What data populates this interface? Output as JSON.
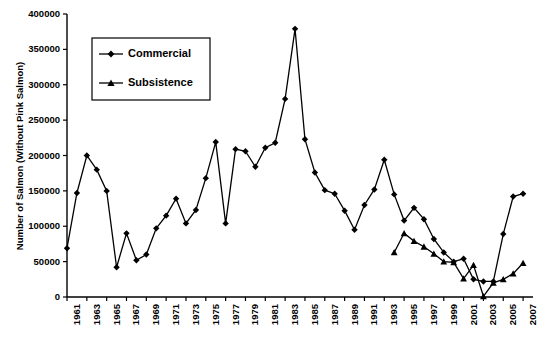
{
  "chart_data": {
    "type": "line",
    "title": "",
    "xlabel": "",
    "ylabel": "Number of Salmon (Without Pink Salmon)",
    "ylim": [
      0,
      400000
    ],
    "ytick_labels": [
      "0",
      "50000",
      "100000",
      "150000",
      "200000",
      "250000",
      "300000",
      "350000",
      "400000"
    ],
    "ytick_values": [
      0,
      50000,
      100000,
      150000,
      200000,
      250000,
      300000,
      350000,
      400000
    ],
    "xlim": [
      1961,
      2008
    ],
    "xtick_labels": [
      "1961",
      "1963",
      "1965",
      "1967",
      "1969",
      "1971",
      "1973",
      "1975",
      "1977",
      "1979",
      "1981",
      "1983",
      "1985",
      "1987",
      "1989",
      "1991",
      "1993",
      "1995",
      "1997",
      "1999",
      "2001",
      "2003",
      "2005",
      "2007"
    ],
    "grid": false,
    "legend_position": "upper-left",
    "series": [
      {
        "name": "Commercial",
        "marker": "diamond",
        "color": "#000000",
        "x": [
          1961,
          1962,
          1963,
          1964,
          1965,
          1966,
          1967,
          1968,
          1969,
          1970,
          1971,
          1972,
          1973,
          1974,
          1975,
          1976,
          1977,
          1978,
          1979,
          1980,
          1981,
          1982,
          1983,
          1984,
          1985,
          1986,
          1987,
          1988,
          1989,
          1990,
          1991,
          1992,
          1993,
          1994,
          1995,
          1996,
          1997,
          1998,
          1999,
          2000,
          2001,
          2002,
          2003,
          2004,
          2005,
          2006,
          2007
        ],
        "y": [
          69000,
          147000,
          200000,
          180000,
          150000,
          42000,
          90000,
          52000,
          60000,
          97000,
          115000,
          139000,
          104000,
          123000,
          168000,
          219000,
          104000,
          209000,
          206000,
          184000,
          211000,
          218000,
          280000,
          379000,
          223000,
          176000,
          151000,
          146000,
          122000,
          95000,
          130000,
          152000,
          194000,
          145000,
          108000,
          126000,
          110000,
          82000,
          63000,
          50000,
          54000,
          25000,
          22000,
          22000,
          89000,
          142000,
          146000
        ]
      },
      {
        "name": "Subsistence",
        "marker": "triangle",
        "color": "#000000",
        "x": [
          1994,
          1995,
          1996,
          1997,
          1998,
          1999,
          2000,
          2001,
          2002,
          2003,
          2004,
          2005,
          2006,
          2007
        ],
        "y": [
          63000,
          90000,
          79000,
          71000,
          61000,
          50000,
          49000,
          26000,
          45000,
          1000,
          20000,
          25000,
          33000,
          48000
        ]
      }
    ],
    "legend": [
      {
        "label": "Commercial",
        "marker": "diamond"
      },
      {
        "label": "Subsistence",
        "marker": "triangle"
      }
    ]
  }
}
